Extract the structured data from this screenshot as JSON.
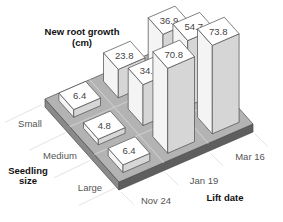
{
  "chart_data": {
    "type": "bar3d",
    "title": "New root growth (cm)",
    "title_lines": [
      "New root growth",
      "(cm)"
    ],
    "row_axis_label_lines": [
      "Seedling",
      "size"
    ],
    "col_axis_label": "Lift date",
    "rows": [
      "Small",
      "Medium",
      "Large"
    ],
    "cols": [
      "Nov 24",
      "Jan 19",
      "Mar 16"
    ],
    "values": [
      [
        6.4,
        23.8,
        36.9
      ],
      [
        4.8,
        34.1,
        54.7
      ],
      [
        6.4,
        70.8,
        73.8
      ]
    ],
    "value_labels": [
      [
        "6.4",
        "23.8",
        "36.9"
      ],
      [
        "4.8",
        "34.1",
        "54.7"
      ],
      [
        "6.4",
        "70.8",
        "73.8"
      ]
    ],
    "zlim": [
      0,
      80
    ],
    "colors": {
      "platform_top": "#b3b3b3",
      "platform_side": "#5e5e5e",
      "platform_side_light": "#8a8a8a",
      "bar_top": "#ffffff",
      "bar_left": "#f4f4f4",
      "bar_right": "#d6d6d6",
      "edge": "#4a4a4a",
      "guide": "#e4e4e4"
    }
  }
}
